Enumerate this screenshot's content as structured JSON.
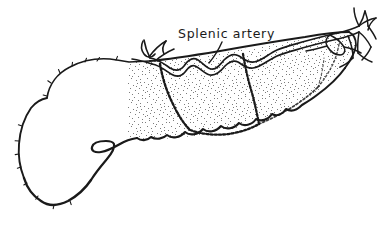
{
  "figure": {
    "kind": "anatomical-line-drawing",
    "background_color": "#ffffff",
    "ink_color": "#1a1a1a",
    "stipple_color": "#8c8c8c",
    "width": 391,
    "height": 230
  },
  "labels": [
    {
      "id": "splenic-artery",
      "text": "Splenic artery",
      "x": 178,
      "y": 38,
      "leader_from_x": 222,
      "leader_from_y": 42,
      "leader_to_x": 209,
      "leader_to_y": 63
    }
  ],
  "regions": [
    {
      "id": "pancreas-head",
      "name": "head of pancreas",
      "shading": "none",
      "fill": "#ffffff"
    },
    {
      "id": "pancreas-body-tail",
      "name": "body and tail of pancreas",
      "shading": "stipple",
      "fill": "#8c8c8c"
    }
  ],
  "structures": [
    {
      "id": "splenic-artery-trunk",
      "name": "splenic artery",
      "style": "double-line tortuous vessel"
    },
    {
      "id": "splenic-artery-branches",
      "name": "splenic artery branches",
      "style": "thin looping vessels"
    },
    {
      "id": "pancreatic-duct",
      "name": "pancreatic duct",
      "style": "beaded dashed line"
    },
    {
      "id": "uncinate-notch",
      "name": "uncinate process notch",
      "style": "hooked contour"
    }
  ]
}
